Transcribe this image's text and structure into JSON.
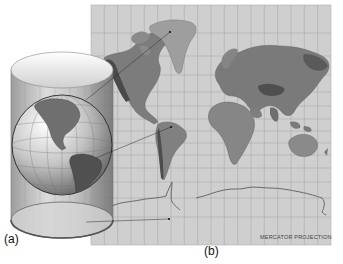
{
  "figure": {
    "panel_a_label": "(a)",
    "panel_b_label": "(b)",
    "map_caption": "MERCATOR PROJECTION",
    "colors": {
      "background": "#ffffff",
      "map_ocean": "#cfcfcf",
      "grid_line": "#9a9a9a",
      "land": "#7a7a7a",
      "land_dark": "#4a4a4a",
      "cylinder": "#b8b8b8",
      "globe": "#9c9c9c",
      "projection_line": "#333333"
    },
    "panel_a": {
      "description": "Transparent cylinder wrapped around a globe showing the Americas",
      "elements": [
        "cylinder",
        "globe",
        "top-ellipse",
        "bottom-ellipse"
      ]
    },
    "panel_b": {
      "description": "Mercator projection world map with latitude/longitude grid",
      "grid_columns": 18,
      "grid_rows": 16
    },
    "projection_lines": [
      {
        "from": "cylinder-upper",
        "to": "greenland"
      },
      {
        "from": "globe-south-america",
        "to": "map-south-america"
      },
      {
        "from": "cylinder-bottom",
        "to": "map-antarctica"
      }
    ]
  }
}
